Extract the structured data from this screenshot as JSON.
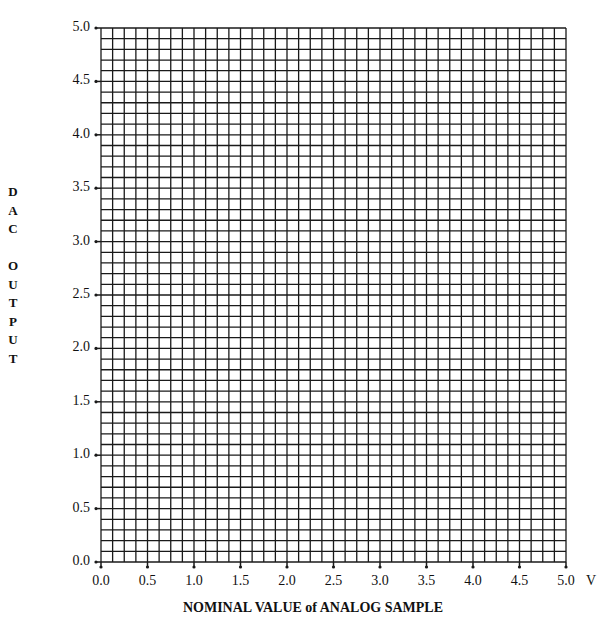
{
  "chart_data": {
    "type": "line",
    "title": "",
    "xlabel": "NOMINAL VALUE of ANALOG SAMPLE",
    "xunit": "V",
    "ylabel": "DAC OUTPUT",
    "ylabel_letters": [
      "D",
      "A",
      "C",
      "",
      "O",
      "U",
      "T",
      "P",
      "U",
      "T"
    ],
    "xlim": [
      0.0,
      5.0
    ],
    "ylim": [
      0.0,
      5.0
    ],
    "x_ticks": [
      "0.0",
      "0.5",
      "1.0",
      "1.5",
      "2.0",
      "2.5",
      "3.0",
      "3.5",
      "4.0",
      "4.5",
      "5.0"
    ],
    "y_ticks": [
      "0.0",
      "0.5",
      "1.0",
      "1.5",
      "2.0",
      "2.5",
      "3.0",
      "3.5",
      "4.0",
      "4.5",
      "5.0"
    ],
    "grid": true,
    "grid_columns": 40,
    "grid_rows": 50,
    "series": []
  },
  "colors": {
    "grid": "#1a1a1a",
    "background": "#ffffff"
  }
}
